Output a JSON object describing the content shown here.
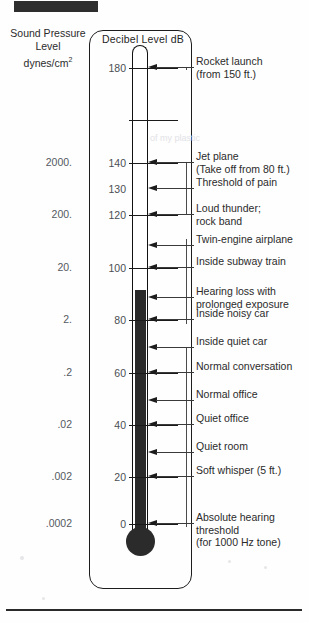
{
  "figure": {
    "redaction_label": "redaction-bar",
    "cut_header_text": "  ",
    "left_axis_heading_line1": "Sound Pressure",
    "left_axis_heading_line2": "Level",
    "left_axis_heading_line3": "dynes/cm",
    "left_axis_heading_exp": "2",
    "scale_title": "Decibel Level dB",
    "ghost_text": "of my plastic"
  },
  "chart_data": {
    "type": "bar",
    "title": "Decibel Level dB",
    "xlabel": "",
    "ylabel": "Decibel Level dB",
    "ylim": [
      0,
      180
    ],
    "grid": false,
    "legend": "none",
    "mercury_fill_db": 92,
    "categories": [
      "Rocket launch (from 150 ft.)",
      "Jet plane (Take off from 80 ft.)",
      "Threshold of pain",
      "Loud thunder; rock band",
      "Twin-engine airplane",
      "Inside subway train",
      "Hearing loss with prolonged exposure",
      "Inside noisy car",
      "Inside quiet car",
      "Normal conversation",
      "Normal office",
      "Quiet office",
      "Quiet room",
      "Soft whisper (5 ft.)",
      "Absolute hearing threshold (for 1000 Hz tone)"
    ],
    "values": [
      180,
      140,
      130,
      120,
      110,
      100,
      90,
      80,
      70,
      60,
      50,
      40,
      30,
      20,
      0
    ],
    "db_ticks": [
      180,
      160,
      140,
      130,
      120,
      100,
      80,
      60,
      40,
      20,
      0
    ],
    "pressure_ticks": [
      "2000.",
      "200.",
      "20.",
      "2.",
      ".2",
      ".02",
      ".002",
      ".0002"
    ],
    "pressure_tick_db": [
      140,
      120,
      100,
      80,
      60,
      40,
      20,
      0
    ],
    "pressure_units": "dynes/cm^2"
  },
  "left_values": [
    {
      "label": "2000.",
      "top": 156
    },
    {
      "label": "200.",
      "top": 208
    },
    {
      "label": "20.",
      "top": 261
    },
    {
      "label": "2.",
      "top": 313
    },
    {
      "label": ".2",
      "top": 366
    },
    {
      "label": ".02",
      "top": 418
    },
    {
      "label": ".002",
      "top": 470
    },
    {
      "label": ".0002",
      "top": 517
    }
  ],
  "ticks": [
    {
      "num": "180",
      "top": 61,
      "line": true,
      "tick_name": "tick-180"
    },
    {
      "num": "",
      "top": 113,
      "line": true,
      "tick_name": "tick-160-unlabeled"
    },
    {
      "num": "140",
      "top": 156,
      "line": true,
      "tick_name": "tick-140"
    },
    {
      "num": "130",
      "top": 182,
      "line": false,
      "tick_name": "tick-130"
    },
    {
      "num": "120",
      "top": 208,
      "line": true,
      "tick_name": "tick-120"
    },
    {
      "num": "",
      "top": 239,
      "line": false,
      "tick_name": "tick-110"
    },
    {
      "num": "100",
      "top": 261,
      "line": true,
      "tick_name": "tick-100"
    },
    {
      "num": "",
      "top": 291,
      "line": false,
      "tick_name": "tick-90"
    },
    {
      "num": "80",
      "top": 313,
      "line": true,
      "tick_name": "tick-80"
    },
    {
      "num": "",
      "top": 341,
      "line": false,
      "tick_name": "tick-70"
    },
    {
      "num": "60",
      "top": 366,
      "line": true,
      "tick_name": "tick-60"
    },
    {
      "num": "",
      "top": 394,
      "line": false,
      "tick_name": "tick-50"
    },
    {
      "num": "40",
      "top": 418,
      "line": true,
      "tick_name": "tick-40"
    },
    {
      "num": "",
      "top": 446,
      "line": false,
      "tick_name": "tick-30"
    },
    {
      "num": "20",
      "top": 470,
      "line": true,
      "tick_name": "tick-20"
    },
    {
      "num": "0",
      "top": 517,
      "line": true,
      "tick_name": "tick-0"
    }
  ],
  "pointers": [
    {
      "top": 61,
      "shaft": 38
    },
    {
      "top": 156,
      "shaft": 38
    },
    {
      "top": 182,
      "shaft": 38
    },
    {
      "top": 208,
      "shaft": 38
    },
    {
      "top": 239,
      "shaft": 38
    },
    {
      "top": 261,
      "shaft": 38
    },
    {
      "top": 291,
      "shaft": 38
    },
    {
      "top": 313,
      "shaft": 38
    },
    {
      "top": 341,
      "shaft": 38
    },
    {
      "top": 366,
      "shaft": 38
    },
    {
      "top": 394,
      "shaft": 38
    },
    {
      "top": 418,
      "shaft": 38
    },
    {
      "top": 446,
      "shaft": 38
    },
    {
      "top": 470,
      "shaft": 38
    },
    {
      "top": 517,
      "shaft": 38
    }
  ],
  "captions": [
    {
      "top": 55,
      "lines": [
        "Rocket launch",
        "(from 150 ft.)"
      ],
      "name": "caption-rocket-launch"
    },
    {
      "top": 150,
      "lines": [
        "Jet plane",
        "(Take off from 80 ft.)"
      ],
      "name": "caption-jet-plane"
    },
    {
      "top": 176,
      "lines": [
        "Threshold of pain"
      ],
      "name": "caption-threshold-of-pain"
    },
    {
      "top": 202,
      "lines": [
        "Loud thunder;",
        "rock band"
      ],
      "name": "caption-loud-thunder"
    },
    {
      "top": 233,
      "lines": [
        "Twin-engine airplane"
      ],
      "name": "caption-twin-engine-airplane"
    },
    {
      "top": 255,
      "lines": [
        "Inside subway train"
      ],
      "name": "caption-inside-subway-train"
    },
    {
      "top": 285,
      "lines": [
        "Hearing loss with",
        "prolonged exposure"
      ],
      "name": "caption-hearing-loss"
    },
    {
      "top": 307,
      "lines": [
        "Inside noisy car"
      ],
      "name": "caption-inside-noisy-car"
    },
    {
      "top": 335,
      "lines": [
        "Inside quiet car"
      ],
      "name": "caption-inside-quiet-car"
    },
    {
      "top": 360,
      "lines": [
        "Normal conversation"
      ],
      "name": "caption-normal-conversation"
    },
    {
      "top": 388,
      "lines": [
        "Normal office"
      ],
      "name": "caption-normal-office"
    },
    {
      "top": 412,
      "lines": [
        "Quiet office"
      ],
      "name": "caption-quiet-office"
    },
    {
      "top": 440,
      "lines": [
        "Quiet room"
      ],
      "name": "caption-quiet-room"
    },
    {
      "top": 464,
      "lines": [
        "Soft whisper (5 ft.)"
      ],
      "name": "caption-soft-whisper"
    },
    {
      "top": 511,
      "lines": [
        "Absolute hearing",
        "threshold",
        "(for 1000 Hz tone)"
      ],
      "name": "caption-absolute-hearing-threshold"
    }
  ],
  "rails": [
    {
      "top": 61,
      "height": 3
    },
    {
      "top": 156,
      "height": 53
    },
    {
      "top": 233,
      "height": 85
    },
    {
      "top": 341,
      "height": 180
    }
  ]
}
